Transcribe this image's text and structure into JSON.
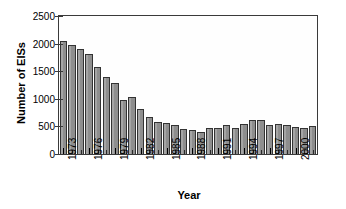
{
  "chart_data": {
    "type": "bar",
    "title": "",
    "xlabel": "Year",
    "ylabel": "Number of EISs",
    "ylim": [
      0,
      2500
    ],
    "yticks": [
      0,
      500,
      1000,
      1500,
      2000,
      2500
    ],
    "ytick_labels": [
      "0",
      "500",
      "1000",
      "1500",
      "2000",
      "2500"
    ],
    "xtick_labels": [
      "1973",
      "1976",
      "1979",
      "1982",
      "1985",
      "1988",
      "1991",
      "1994",
      "1997",
      "2000"
    ],
    "xtick_years": [
      1973,
      1976,
      1979,
      1982,
      1985,
      1988,
      1991,
      1994,
      1997,
      2000
    ],
    "grid": false,
    "legend": "none",
    "bar_color": "#8e8e8e",
    "bar_edge_color": "#333333",
    "categories": [
      "1973",
      "1974",
      "1975",
      "1976",
      "1977",
      "1978",
      "1979",
      "1980",
      "1981",
      "1982",
      "1983",
      "1984",
      "1985",
      "1986",
      "1987",
      "1988",
      "1989",
      "1990",
      "1991",
      "1992",
      "1993",
      "1994",
      "1995",
      "1996",
      "1997",
      "1998",
      "1999",
      "2000",
      "2001",
      "2002"
    ],
    "values": [
      2050,
      1980,
      1900,
      1820,
      1580,
      1390,
      1290,
      980,
      1040,
      820,
      670,
      580,
      560,
      520,
      460,
      440,
      390,
      480,
      470,
      520,
      470,
      540,
      615,
      610,
      520,
      540,
      520,
      485,
      480,
      505
    ]
  },
  "axes": {
    "ylabel": "Number of EISs",
    "xlabel": "Year"
  }
}
